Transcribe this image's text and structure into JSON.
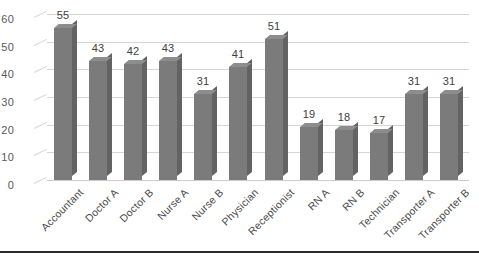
{
  "chart_data": {
    "type": "bar",
    "title": "",
    "subtitle": "",
    "xlabel": "",
    "ylabel": "",
    "ylim": [
      0,
      60
    ],
    "ytick_step": 10,
    "yticks": [
      0,
      10,
      20,
      30,
      40,
      50,
      60
    ],
    "grid": true,
    "legend": false,
    "legend_position": "none",
    "data_labels": true,
    "style": "3d-column",
    "categories": [
      "Accountant",
      "Doctor A",
      "Doctor B",
      "Nurse A",
      "Nurse B",
      "Physician",
      "Receptionist",
      "RN A",
      "RN B",
      "Technician",
      "Transporter A",
      "Transporter B"
    ],
    "values": [
      55,
      43,
      42,
      43,
      31,
      41,
      51,
      19,
      18,
      17,
      31,
      31
    ]
  },
  "colors": {
    "bar_front": "#7b7b7b",
    "bar_side": "#636363",
    "bar_top": "#8d8d8d",
    "gridline": "#d6d6d6",
    "axis_text": "#595959",
    "label_text": "#404040",
    "figure_rule": "#2b2b2b",
    "background": "#ffffff"
  }
}
